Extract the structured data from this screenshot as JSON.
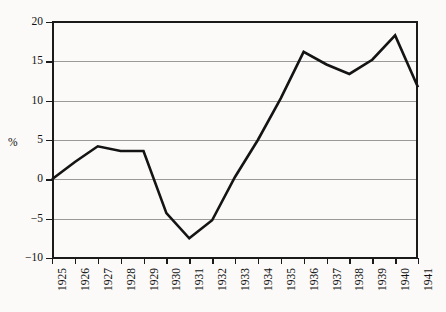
{
  "chart_data": {
    "type": "line",
    "title": "",
    "subtitle": "",
    "xlabel": "",
    "ylabel": "%",
    "ylim": [
      -10,
      20
    ],
    "yticks": [
      -10,
      -5,
      0,
      5,
      10,
      15,
      20
    ],
    "ytick_labels": [
      "−10",
      "−5",
      "0",
      "5",
      "10",
      "15",
      "20"
    ],
    "grid": true,
    "legend": "none",
    "line_color": "#141414",
    "grid_color": "#9a9a9a",
    "background_color": "#fbfaf8",
    "axis_color": "#1a1a1a",
    "categories": [
      "1925",
      "1926",
      "1927",
      "1928",
      "1929",
      "1930",
      "1931",
      "1932",
      "1933",
      "1934",
      "1935",
      "1936",
      "1937",
      "1938",
      "1939",
      "1940",
      "1941"
    ],
    "x": [
      1925,
      1926,
      1927,
      1928,
      1929,
      1930,
      1931,
      1932,
      1933,
      1934,
      1935,
      1936,
      1937,
      1938,
      1939,
      1940,
      1941
    ],
    "values": [
      0.0,
      2.2,
      4.2,
      3.6,
      3.6,
      -4.3,
      -7.5,
      -5.2,
      0.3,
      5.0,
      10.3,
      16.2,
      14.6,
      13.4,
      15.2,
      18.3,
      11.7
    ],
    "series": [
      {
        "name": "%",
        "values": [
          0.0,
          2.2,
          4.2,
          3.6,
          3.6,
          -4.3,
          -7.5,
          -5.2,
          0.3,
          5.0,
          10.3,
          16.2,
          14.6,
          13.4,
          15.2,
          18.3,
          11.7
        ]
      }
    ]
  }
}
